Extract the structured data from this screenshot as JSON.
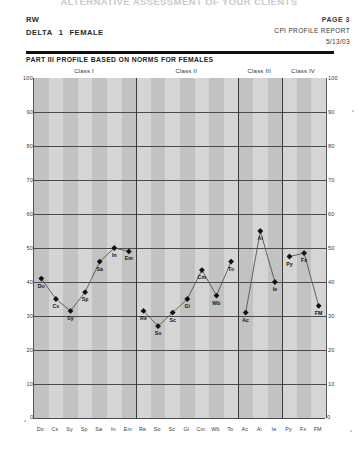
{
  "document": {
    "cut_off_title": "ALTERNATIVE ASSESSMENT OF YOUR CLIENTS",
    "subject_id": "RW",
    "form_label": "DELTA",
    "form_number": "1",
    "gender": "FEMALE",
    "page_label": "PAGE 3",
    "report_title": "CPI PROFILE REPORT",
    "date": "5/13/03",
    "section_title": "PART III PROFILE BASED ON NORMS FOR FEMALES"
  },
  "chart_data": {
    "type": "line",
    "title": "PART III PROFILE BASED ON NORMS FOR FEMALES",
    "xlabel": "",
    "ylabel": "",
    "ylim": [
      0,
      100
    ],
    "yticks": [
      100,
      90,
      80,
      70,
      60,
      50,
      40,
      30,
      20,
      10
    ],
    "grid": true,
    "legend": "none",
    "categories": [
      "Do",
      "Cs",
      "Sy",
      "Sp",
      "Sa",
      "In",
      "Em",
      "Re",
      "So",
      "Sc",
      "Gi",
      "Cm",
      "Wb",
      "To",
      "Ac",
      "Ai",
      "Ie",
      "Py",
      "Fx",
      "FM"
    ],
    "values": [
      41,
      35,
      31.5,
      37,
      46,
      50,
      49,
      31.5,
      27,
      31,
      35,
      43.5,
      36,
      46,
      31,
      55,
      40,
      47.5,
      48.5,
      33
    ],
    "point_labels": [
      "Do",
      "Cs",
      "Sy",
      "Sp",
      "Sa",
      "In",
      "Em",
      "Re",
      "So",
      "Sc",
      "Gi",
      "Cm",
      "Wb",
      "To",
      "Ac",
      "Ai",
      "Ie",
      "Py",
      "Fx",
      "FM"
    ],
    "class_groups": [
      {
        "label": "Class I",
        "start": 0,
        "end": 6
      },
      {
        "label": "Class II",
        "start": 7,
        "end": 13
      },
      {
        "label": "Class III",
        "start": 14,
        "end": 16
      },
      {
        "label": "Class IV",
        "start": 17,
        "end": 19
      }
    ],
    "colors": {
      "plot_background": "#d5d5d5",
      "band": "#c2c2c2",
      "gridline": "#4a4a4a",
      "marker": "#111111",
      "line": "#555555"
    }
  }
}
